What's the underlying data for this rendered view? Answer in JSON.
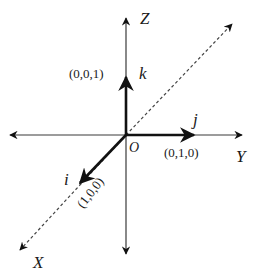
{
  "diagram": {
    "origin_label": "O",
    "axes": {
      "z": {
        "label": "Z"
      },
      "y": {
        "label": "Y"
      },
      "x": {
        "label": "X"
      }
    },
    "vectors": {
      "i": {
        "label": "i",
        "coords": "(1,0,0)"
      },
      "j": {
        "label": "j",
        "coords": "(0,1,0)"
      },
      "k": {
        "label": "k",
        "coords": "(0,0,1)"
      }
    },
    "colors": {
      "axis": "#3a3a3a",
      "vector": "#111111",
      "dashed": "#444444",
      "text": "#1a1a1a"
    }
  }
}
